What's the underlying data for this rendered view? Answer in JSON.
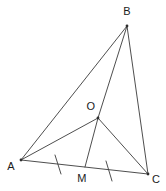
{
  "figure": {
    "background_color": "#ffffff",
    "stroke_color": "#3a3a3a",
    "label_color": "#1b1b1b",
    "width": 166,
    "height": 191,
    "points": {
      "A": {
        "label": "A",
        "x": 21,
        "y": 160,
        "label_x": 11,
        "label_y": 170
      },
      "B": {
        "label": "B",
        "x": 127,
        "y": 26,
        "label_x": 127,
        "label_y": 15
      },
      "C": {
        "label": "C",
        "x": 148,
        "y": 174,
        "label_x": 156,
        "label_y": 183
      },
      "O": {
        "label": "O",
        "x": 98,
        "y": 118,
        "label_x": 91,
        "label_y": 110
      },
      "M": {
        "label": "M",
        "x": 85,
        "y": 167,
        "label_x": 82,
        "label_y": 182
      }
    },
    "segments": [
      {
        "name": "side-AB",
        "from": "A",
        "to": "B"
      },
      {
        "name": "side-BC",
        "from": "B",
        "to": "C"
      },
      {
        "name": "side-AC",
        "from": "A",
        "to": "C"
      },
      {
        "name": "cevian-BO",
        "from": "B",
        "to": "O"
      },
      {
        "name": "cevian-OM",
        "from": "O",
        "to": "M"
      },
      {
        "name": "cevian-AO",
        "from": "A",
        "to": "O"
      },
      {
        "name": "cevian-OC",
        "from": "O",
        "to": "C"
      }
    ],
    "tick_marks": [
      {
        "name": "tick-AM",
        "on_segment": "A-M",
        "x": 58,
        "y": 164,
        "count": 1
      },
      {
        "name": "tick-MC",
        "on_segment": "M-C",
        "x": 109,
        "y": 171,
        "count": 1
      }
    ],
    "notes": {
      "equal_marks": "Single ticks on AM and MC indicate AM = MC (M is the midpoint of AC)."
    }
  }
}
